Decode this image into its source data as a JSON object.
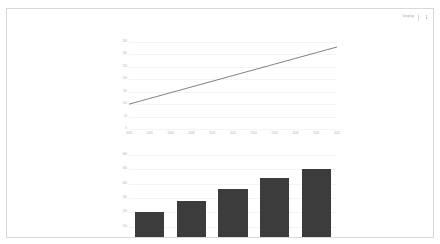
{
  "header": {
    "display_label": "Display",
    "menu_icon": "kebab-menu-icon"
  },
  "colors": {
    "bar_fill": "#3c3c3c",
    "line_stroke": "#4a4a4a",
    "gridline": "#f4f4f4",
    "axis": "#e2e2e2",
    "tick_text": "#b0b0b0",
    "frame_border": "#d8d8d8",
    "background": "#ffffff"
  },
  "chart_data": [
    {
      "type": "line",
      "title": "",
      "subtitle": "",
      "xlabel": "",
      "ylabel": "",
      "grid": true,
      "legend": "none",
      "x": [
        "2003",
        "2005",
        "2006",
        "2008",
        "2010",
        "2012",
        "2014",
        "2016",
        "2018",
        "2020",
        "2022"
      ],
      "xtick_labels": [
        "2003",
        "2005",
        "2006",
        "2008",
        "2010",
        "2012",
        "2014",
        "2016",
        "2018",
        "2020",
        "2022"
      ],
      "ytick_labels": [
        "0",
        "50",
        "100",
        "150",
        "200",
        "250",
        "300",
        "350"
      ],
      "ylim": [
        0,
        350
      ],
      "series": [
        {
          "name": "Trend",
          "values": [
            100,
            123,
            146,
            169,
            192,
            215,
            238,
            261,
            284,
            307,
            330
          ]
        }
      ]
    },
    {
      "type": "bar",
      "title": "",
      "subtitle": "",
      "xlabel": "",
      "ylabel": "",
      "grid": true,
      "legend": "none",
      "categories": [
        "1",
        "2",
        "3",
        "4",
        "5"
      ],
      "values": [
        200,
        280,
        360,
        440,
        500
      ],
      "ytick_labels": [
        "0",
        "100",
        "200",
        "300",
        "400",
        "500",
        "600"
      ],
      "ylim": [
        0,
        600
      ]
    }
  ]
}
